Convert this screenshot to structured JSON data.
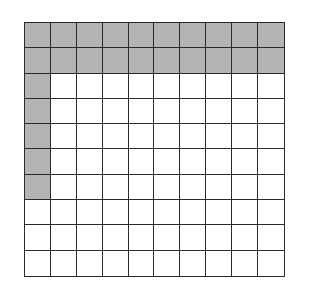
{
  "diagram": {
    "type": "hundred-grid",
    "rows": 10,
    "cols": 10,
    "shaded_count": 25,
    "shaded_cells": [
      [
        0,
        0
      ],
      [
        0,
        1
      ],
      [
        0,
        2
      ],
      [
        0,
        3
      ],
      [
        0,
        4
      ],
      [
        0,
        5
      ],
      [
        0,
        6
      ],
      [
        0,
        7
      ],
      [
        0,
        8
      ],
      [
        0,
        9
      ],
      [
        1,
        0
      ],
      [
        1,
        1
      ],
      [
        1,
        2
      ],
      [
        1,
        3
      ],
      [
        1,
        4
      ],
      [
        1,
        5
      ],
      [
        1,
        6
      ],
      [
        1,
        7
      ],
      [
        1,
        8
      ],
      [
        1,
        9
      ],
      [
        2,
        0
      ],
      [
        3,
        0
      ],
      [
        4,
        0
      ],
      [
        5,
        0
      ],
      [
        6,
        0
      ]
    ],
    "colors": {
      "shaded": "#b4b4b4",
      "unshaded": "#ffffff",
      "grid_line": "#2a2a2a"
    }
  }
}
